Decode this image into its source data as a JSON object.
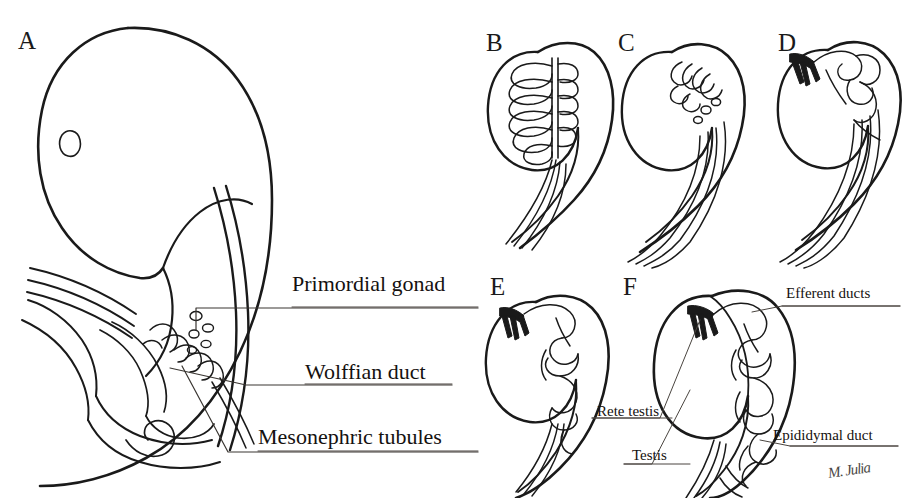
{
  "figure": {
    "background_color": "#ffffff",
    "ink_color": "#1a1a1a",
    "style": "pen-and-ink line drawing",
    "width": 902,
    "height": 498
  },
  "panels": [
    {
      "id": "A",
      "letter": "A",
      "x": 18,
      "y": 28,
      "caption": "Whole embryo in sagittal view showing urogenital ridge"
    },
    {
      "id": "B",
      "letter": "B",
      "x": 486,
      "y": 30,
      "caption": "Primordial gonad with ladder-like mesonephric tubules"
    },
    {
      "id": "C",
      "letter": "C",
      "x": 618,
      "y": 30,
      "caption": "Partial regression of cranial mesonephric tubules"
    },
    {
      "id": "D",
      "letter": "D",
      "x": 778,
      "y": 30,
      "caption": "Rete testis forming; tubules becoming convoluted"
    },
    {
      "id": "E",
      "letter": "E",
      "x": 490,
      "y": 274,
      "caption": "Efferent ducts elongating and coiling"
    },
    {
      "id": "F",
      "letter": "F",
      "x": 623,
      "y": 274,
      "caption": "Mature testis with epididymis"
    }
  ],
  "callouts": [
    {
      "id": "primordial-gonad",
      "text": "Primordial gonad",
      "size": "big",
      "x": 292,
      "y": 272
    },
    {
      "id": "wolffian-duct",
      "text": "Wolffian duct",
      "size": "big",
      "x": 305,
      "y": 360
    },
    {
      "id": "mesonephric-tubules",
      "text": "Mesonephric tubules",
      "size": "big",
      "x": 258,
      "y": 425
    },
    {
      "id": "efferent-ducts",
      "text": "Efferent ducts",
      "size": "small",
      "x": 786,
      "y": 285
    },
    {
      "id": "rete-testis",
      "text": "Rete testis",
      "size": "small",
      "x": 597,
      "y": 403
    },
    {
      "id": "testis",
      "text": "Testis",
      "size": "small",
      "x": 632,
      "y": 447
    },
    {
      "id": "epididymal-duct",
      "text": "Epididymal duct",
      "size": "small",
      "x": 773,
      "y": 427
    }
  ],
  "signature": {
    "text": "M. Julia",
    "x": 828,
    "y": 462
  }
}
